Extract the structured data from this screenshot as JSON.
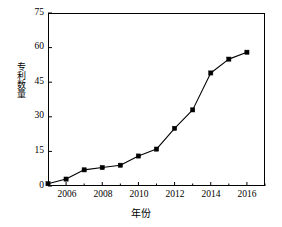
{
  "chart_data": {
    "type": "line",
    "title": "",
    "xlabel": "年份",
    "ylabel": "专利数量",
    "x": [
      2005,
      2006,
      2007,
      2008,
      2009,
      2010,
      2011,
      2012,
      2013,
      2014,
      2015,
      2016
    ],
    "values": [
      1,
      3,
      7,
      8,
      9,
      13,
      16,
      25,
      33,
      49,
      55,
      58
    ],
    "series": [
      {
        "name": "专利数量",
        "values": [
          1,
          3,
          7,
          8,
          9,
          13,
          16,
          25,
          33,
          49,
          55,
          58
        ]
      }
    ],
    "xlim": [
      2005,
      2017
    ],
    "ylim": [
      0,
      75
    ],
    "xticks": [
      2006,
      2008,
      2010,
      2012,
      2014,
      2016
    ],
    "xtick_labels": [
      "2006",
      "2008",
      "2010",
      "2012",
      "2014",
      "2016"
    ],
    "xminor_ticks": [
      2005,
      2007,
      2009,
      2011,
      2013,
      2015,
      2017
    ],
    "yticks": [
      0,
      15,
      30,
      45,
      60,
      75
    ],
    "ytick_labels": [
      "0",
      "15",
      "30",
      "45",
      "60",
      "75"
    ],
    "grid": false,
    "legend": false,
    "legend_position": "none",
    "marker": "square",
    "line_color": "#000000",
    "marker_color": "#000000",
    "background_color": "#ffffff",
    "frame_color": "#000000"
  }
}
